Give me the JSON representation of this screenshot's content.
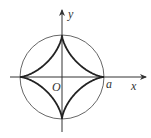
{
  "diagram": {
    "labels": {
      "y_axis": "y",
      "x_axis": "x",
      "origin": "O",
      "a": "a"
    },
    "colors": {
      "axis": "#333333",
      "circle": "#555555",
      "curve": "#222222",
      "label": "#333333"
    }
  }
}
